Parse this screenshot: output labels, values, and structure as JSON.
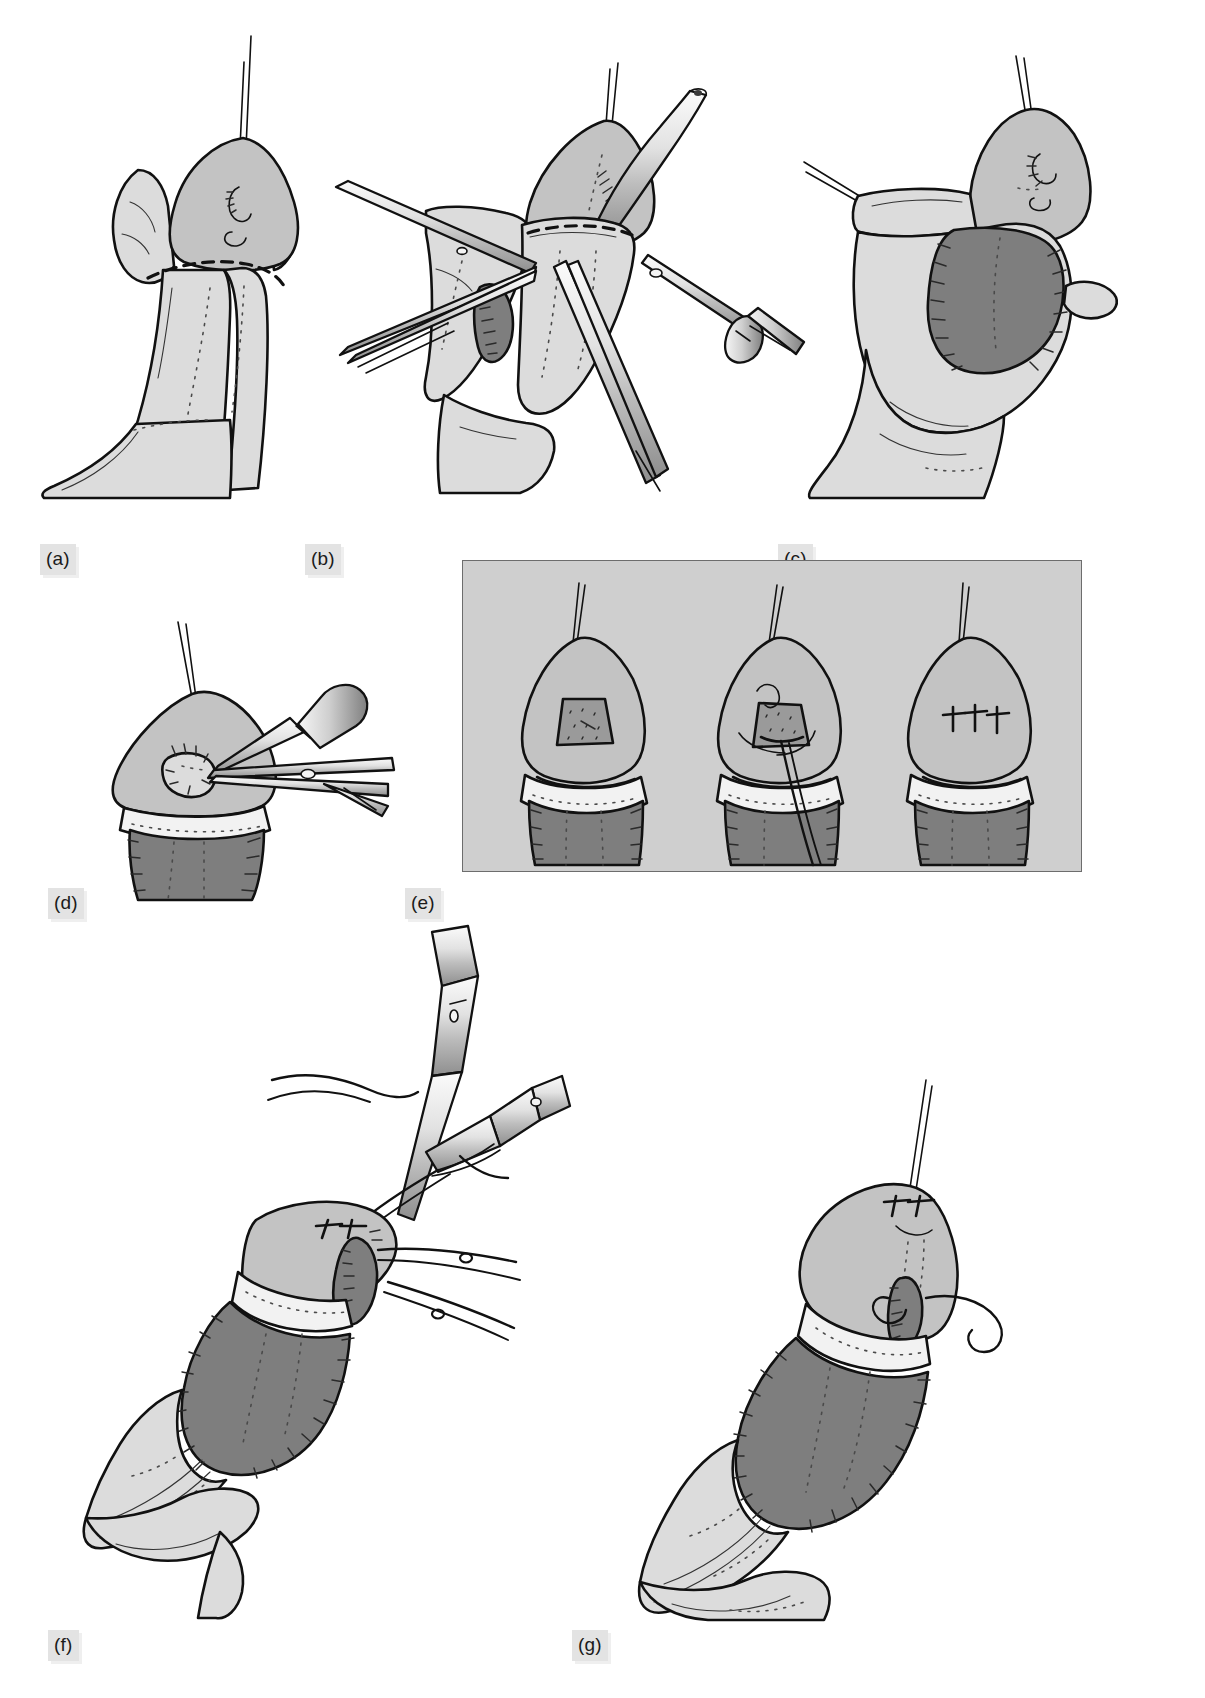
{
  "figure": {
    "panel_count": 7,
    "background_color": "#ffffff",
    "label_chip_color": "#e3e3e3",
    "label_text_color": "#1a1a1a",
    "inset_background_color": "#cfcfcf",
    "inset_border_color": "#6d6d6d",
    "palette": {
      "outline": "#111111",
      "skin_light": "#dcdcdc",
      "skin_mid": "#c3c3c3",
      "graft_dark": "#9a9a9a",
      "cavity_deep": "#7e7e7e",
      "highlight": "#f2f2f2",
      "instrument_steel": "#d6d6d6"
    }
  },
  "panels": [
    {
      "id": "a",
      "label": "(a)",
      "caption_text": "(a)",
      "description": "Shaft held by traction suture; dashed incision line marked at the corona with dotted midline landmarks distally.",
      "elements": [
        "traction-suture",
        "glans",
        "dashed-incision-line",
        "dotted-midline-markings",
        "shaft",
        "retracted-skin"
      ]
    },
    {
      "id": "b",
      "label": "(b)",
      "caption_text": "(b)",
      "description": "Dissection in progress: toothed forceps, fine scissors and a flat retractor elevate the skin edges while a catheter lies along the dorsum.",
      "elements": [
        "traction-suture",
        "catheter",
        "toothed-forceps",
        "fine-scissors",
        "flat-retractor",
        "dashed-incision-line",
        "opened-plane"
      ]
    },
    {
      "id": "c",
      "label": "(c)",
      "caption_text": "(c)",
      "description": "Shaft degloved and rotated; the exposed graft bed is shown with sutured margins on either side.",
      "elements": [
        "traction-suture",
        "stay-sutures",
        "graft-bed",
        "running-suture-line",
        "skin-cuff",
        "forceps-tip"
      ]
    },
    {
      "id": "d",
      "label": "(d)",
      "caption_text": "(d)",
      "description": "Meatal area opened; a flat retractor holds the glans while fine scissors trim the meatal edge.",
      "elements": [
        "traction-suture",
        "flat-retractor",
        "fine-scissors",
        "meatus",
        "glans",
        "graft-bed"
      ]
    },
    {
      "id": "e",
      "label": "(e)",
      "caption_text": "(e)",
      "is_inset_box": true,
      "description": "Boxed inset: three sequential glans views of meatal closure.",
      "sub_panels": [
        {
          "index": 1,
          "stage_label": "",
          "description": "Triangular meatal defect exposed within the glans, ventral shaft sutured."
        },
        {
          "index": 2,
          "stage_label": "",
          "description": "Suture passed through the defect margins with needle and thread drawn ventrally."
        },
        {
          "index": 3,
          "stage_label": "",
          "description": "Defect closed with three interrupted sutures; meatus reconstructed."
        }
      ]
    },
    {
      "id": "f",
      "label": "(f)",
      "caption_text": "(f)",
      "description": "Glansplasty: two needle holders carry curved needles and sutures across the neomeatus, with suture ends held on the right.",
      "elements": [
        "needle-holder-upper",
        "needle-holder-lower",
        "curved-needle",
        "suture-strands",
        "interrupted-sutures",
        "neomeatus",
        "graft",
        "skin-cuff"
      ]
    },
    {
      "id": "g",
      "label": "(g)",
      "caption_text": "(g)",
      "description": "Completed repair: interrupted glans sutures in place with a single suture tail trailing; graft and skin cuff closed.",
      "elements": [
        "traction-suture",
        "interrupted-sutures",
        "suture-tail",
        "neomeatus",
        "graft",
        "skin-cuff",
        "shaft"
      ]
    }
  ]
}
